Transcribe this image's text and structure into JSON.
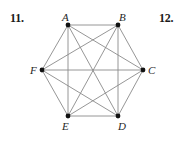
{
  "figure": {
    "problem_numbers": {
      "left": "11.",
      "right": "12."
    },
    "graph": {
      "type": "complete-graph",
      "name": "K6",
      "vertex_count": 6,
      "edge_count": 15,
      "shape": "hexagon",
      "vertex_color": "#111111",
      "edge_color": "#8a8a8a",
      "background_color": "#ffffff",
      "vertices": [
        {
          "id": "A",
          "label": "A",
          "x": 68,
          "y": 25,
          "label_x": 62,
          "label_y": 12
        },
        {
          "id": "B",
          "label": "B",
          "x": 118,
          "y": 25,
          "label_x": 119,
          "label_y": 12
        },
        {
          "id": "C",
          "label": "C",
          "x": 143,
          "y": 70,
          "label_x": 148,
          "label_y": 65
        },
        {
          "id": "D",
          "label": "D",
          "x": 118,
          "y": 116,
          "label_x": 118,
          "label_y": 121
        },
        {
          "id": "E",
          "label": "E",
          "x": 68,
          "y": 116,
          "label_x": 62,
          "label_y": 121
        },
        {
          "id": "F",
          "label": "F",
          "x": 42,
          "y": 70,
          "label_x": 30,
          "label_y": 65
        }
      ],
      "edges": [
        [
          "A",
          "B"
        ],
        [
          "A",
          "C"
        ],
        [
          "A",
          "D"
        ],
        [
          "A",
          "E"
        ],
        [
          "A",
          "F"
        ],
        [
          "B",
          "C"
        ],
        [
          "B",
          "D"
        ],
        [
          "B",
          "E"
        ],
        [
          "B",
          "F"
        ],
        [
          "C",
          "D"
        ],
        [
          "C",
          "E"
        ],
        [
          "C",
          "F"
        ],
        [
          "D",
          "E"
        ],
        [
          "D",
          "F"
        ],
        [
          "E",
          "F"
        ]
      ]
    }
  }
}
